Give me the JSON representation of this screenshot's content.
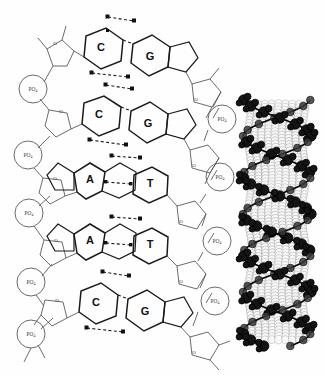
{
  "figure": {
    "background_color": "#fefefe",
    "ink_color": "#1a1a1a",
    "line_color": "#55555a",
    "panels": [
      {
        "name": "ladder-schematic",
        "position": "left"
      },
      {
        "name": "space-filling-helix",
        "position": "right"
      }
    ]
  },
  "schematic": {
    "base_pairs": [
      {
        "index": 1,
        "left_base": "C",
        "right_base": "G",
        "hydrogen_bonds": 3,
        "left_type": "pyrimidine",
        "right_type": "purine"
      },
      {
        "index": 2,
        "left_base": "C",
        "right_base": "G",
        "hydrogen_bonds": 3,
        "left_type": "pyrimidine",
        "right_type": "purine"
      },
      {
        "index": 3,
        "left_base": "A",
        "right_base": "T",
        "hydrogen_bonds": 2,
        "left_type": "purine",
        "right_type": "pyrimidine"
      },
      {
        "index": 4,
        "left_base": "A",
        "right_base": "T",
        "hydrogen_bonds": 2,
        "left_type": "purine",
        "right_type": "pyrimidine"
      },
      {
        "index": 5,
        "left_base": "C",
        "right_base": "G",
        "hydrogen_bonds": 3,
        "left_type": "pyrimidine",
        "right_type": "purine"
      }
    ],
    "phosphate_label": "PO",
    "phosphate_subscript": "4",
    "phosphate_count_left": 5,
    "phosphate_count_right": 4,
    "sugar_oxygen_label": "O",
    "sugar_count_left": 5,
    "sugar_count_right": 5,
    "sugar_name": "deoxyribose",
    "bond_style": "dashed",
    "bond_endpoint_shape": "square"
  },
  "helix_model": {
    "name": "space-filling-model",
    "sphere_fill": "#fbfbfb",
    "sphere_stroke": "#9a9a9a",
    "backbone_fill": "#141414",
    "backbone_stroke": "#000000",
    "turns": 3,
    "strands": 2
  }
}
